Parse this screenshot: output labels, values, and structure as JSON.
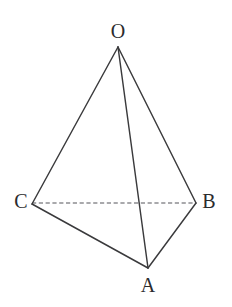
{
  "figure": {
    "type": "geometric-solid-diagram",
    "canvas": {
      "width": 232,
      "height": 307,
      "background": "#ffffff"
    },
    "style": {
      "solid_edge_color": "#3a3a3c",
      "solid_edge_width": 1.45,
      "dashed_edge_color": "#55555a",
      "dashed_edge_width": 1.2,
      "dash_pattern": "4.2 2.6",
      "label_color": "#2b2b2d",
      "label_font_size": 20
    },
    "vertices": [
      {
        "id": "O",
        "label": "O",
        "x": 118,
        "y": 47,
        "label_x": 118,
        "label_y": 31,
        "name": "vertex-o"
      },
      {
        "id": "C",
        "label": "C",
        "x": 32,
        "y": 204,
        "label_x": 21,
        "label_y": 201,
        "name": "vertex-c"
      },
      {
        "id": "B",
        "label": "B",
        "x": 196,
        "y": 203,
        "label_x": 209,
        "label_y": 201,
        "name": "vertex-b"
      },
      {
        "id": "A",
        "label": "A",
        "x": 148,
        "y": 268,
        "label_x": 148,
        "label_y": 285,
        "name": "vertex-a"
      }
    ],
    "edges": [
      {
        "id": "OC",
        "from": "O",
        "to": "C",
        "style": "solid",
        "hidden": false,
        "d": "M 118 47 L 32 204"
      },
      {
        "id": "OB",
        "from": "O",
        "to": "B",
        "style": "solid",
        "hidden": false,
        "d": "M 118 47 L 196 203"
      },
      {
        "id": "OA",
        "from": "O",
        "to": "A",
        "style": "solid",
        "hidden": false,
        "d": "M 118 47 L 148 268"
      },
      {
        "id": "CA",
        "from": "C",
        "to": "A",
        "style": "solid",
        "hidden": false,
        "d": "M 32 204 L 148 268"
      },
      {
        "id": "AB",
        "from": "A",
        "to": "B",
        "style": "solid",
        "hidden": false,
        "d": "M 148 268 L 196 203"
      },
      {
        "id": "CB",
        "from": "C",
        "to": "B",
        "style": "dashed",
        "hidden": true,
        "d": "M 32 203 L 196 203"
      }
    ]
  }
}
